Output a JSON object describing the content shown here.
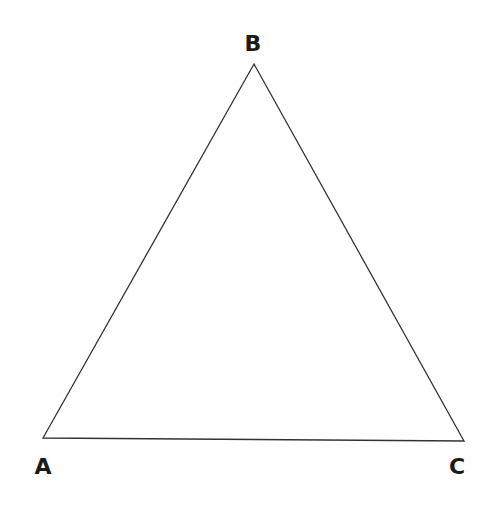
{
  "diagram": {
    "type": "triangle",
    "stroke_color": "#333333",
    "label_color": "#1a1a1a",
    "vertices": [
      {
        "name": "A",
        "x": 43,
        "y": 438,
        "label_x": 43,
        "label_y": 474
      },
      {
        "name": "B",
        "x": 254,
        "y": 64,
        "label_x": 253,
        "label_y": 51
      },
      {
        "name": "C",
        "x": 464,
        "y": 441,
        "label_x": 457,
        "label_y": 474
      }
    ]
  }
}
